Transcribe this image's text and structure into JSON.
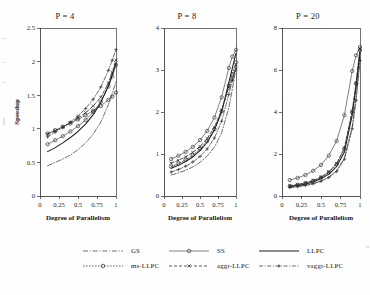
{
  "figure": {
    "background": "#fefefe",
    "ink": "#2b2b2b"
  },
  "axis": {
    "xlabel": "Degree of Parallelism",
    "ylabel": "Speedup",
    "xticks": [
      "0",
      "0.25",
      "0.5",
      "0.75",
      "1"
    ],
    "xtickvals": [
      0,
      0.25,
      0.5,
      0.75,
      1
    ]
  },
  "legend": {
    "rows": [
      [
        {
          "label": "GS",
          "style": "dashdot-long",
          "marker": "none"
        },
        {
          "label": "SS",
          "style": "solid-thin",
          "marker": "circle"
        },
        {
          "label": "LLPC",
          "style": "solid",
          "marker": "none"
        }
      ],
      [
        {
          "label": "ms-LLPC",
          "style": "dashed-fine",
          "marker": "circle"
        },
        {
          "label": "aggr-LLPC",
          "style": "dashed",
          "marker": "x"
        },
        {
          "label": "vaggr-LLPC",
          "style": "dashdot",
          "marker": "plus"
        }
      ]
    ]
  },
  "chart_data": [
    {
      "type": "line",
      "title": "P = 4",
      "xlabel": "Degree of Parallelism",
      "ylabel": "Speedup",
      "xlim": [
        0,
        1
      ],
      "ylim": [
        0,
        2.5
      ],
      "yticks": [
        0,
        0.5,
        1,
        1.5,
        2,
        2.5
      ],
      "yticklabels": [
        "0",
        "0.5",
        "1",
        "1.5",
        "2",
        "2.5"
      ],
      "grid": false,
      "legend_position": "below",
      "x": [
        0.1,
        0.2,
        0.3,
        0.4,
        0.5,
        0.6,
        0.7,
        0.8,
        0.9,
        0.95,
        1.0
      ],
      "series": [
        {
          "name": "GS",
          "style": "dashdot-long",
          "marker": "none",
          "values": [
            0.45,
            0.5,
            0.55,
            0.61,
            0.69,
            0.79,
            0.92,
            1.1,
            1.36,
            1.52,
            1.7
          ]
        },
        {
          "name": "SS",
          "style": "solid-thin",
          "marker": "circle",
          "values": [
            0.77,
            0.83,
            0.89,
            0.96,
            1.04,
            1.13,
            1.25,
            1.4,
            1.63,
            1.78,
            1.95
          ]
        },
        {
          "name": "LLPC",
          "style": "solid",
          "marker": "none",
          "values": [
            0.66,
            0.72,
            0.79,
            0.87,
            0.96,
            1.07,
            1.21,
            1.39,
            1.64,
            1.8,
            1.98
          ]
        },
        {
          "name": "ms-LLPC",
          "style": "dashed-fine",
          "marker": "circle",
          "values": [
            0.93,
            0.98,
            1.03,
            1.08,
            1.14,
            1.2,
            1.27,
            1.34,
            1.43,
            1.48,
            1.54
          ]
        },
        {
          "name": "aggr-LLPC",
          "style": "dashed",
          "marker": "x",
          "values": [
            0.92,
            0.97,
            1.03,
            1.09,
            1.16,
            1.24,
            1.34,
            1.47,
            1.68,
            1.84,
            2.02
          ]
        },
        {
          "name": "vaggr-LLPC",
          "style": "dashdot",
          "marker": "plus",
          "values": [
            0.88,
            0.95,
            1.02,
            1.1,
            1.19,
            1.3,
            1.44,
            1.62,
            1.87,
            2.02,
            2.18
          ]
        }
      ]
    },
    {
      "type": "line",
      "title": "P = 8",
      "xlabel": "Degree of Parallelism",
      "ylabel": "Speedup",
      "xlim": [
        0,
        1
      ],
      "ylim": [
        0,
        4
      ],
      "yticks": [
        0,
        1,
        2,
        3,
        4
      ],
      "yticklabels": [
        "0",
        "1",
        "2",
        "3",
        "4"
      ],
      "grid": false,
      "legend_position": "below",
      "x": [
        0.1,
        0.2,
        0.3,
        0.4,
        0.5,
        0.6,
        0.7,
        0.8,
        0.9,
        0.95,
        1.0
      ],
      "series": [
        {
          "name": "GS",
          "style": "dashdot-long",
          "marker": "none",
          "values": [
            0.5,
            0.55,
            0.61,
            0.69,
            0.8,
            0.95,
            1.16,
            1.5,
            2.1,
            2.55,
            3.05
          ]
        },
        {
          "name": "SS",
          "style": "solid-thin",
          "marker": "circle",
          "values": [
            0.88,
            0.96,
            1.05,
            1.17,
            1.33,
            1.55,
            1.87,
            2.35,
            3.05,
            3.32,
            3.48
          ]
        },
        {
          "name": "LLPC",
          "style": "solid",
          "marker": "none",
          "values": [
            0.66,
            0.73,
            0.82,
            0.93,
            1.08,
            1.28,
            1.57,
            2.0,
            2.7,
            3.05,
            3.4
          ]
        },
        {
          "name": "ms-LLPC",
          "style": "dashed-fine",
          "marker": "circle",
          "values": [
            0.7,
            0.77,
            0.86,
            0.97,
            1.12,
            1.31,
            1.59,
            2.02,
            2.63,
            2.9,
            3.18
          ]
        },
        {
          "name": "aggr-LLPC",
          "style": "dashed",
          "marker": "x",
          "values": [
            0.78,
            0.85,
            0.93,
            1.04,
            1.18,
            1.37,
            1.64,
            2.04,
            2.58,
            2.8,
            3.02
          ]
        },
        {
          "name": "vaggr-LLPC",
          "style": "dashdot",
          "marker": "plus",
          "values": [
            0.57,
            0.63,
            0.71,
            0.81,
            0.94,
            1.12,
            1.38,
            1.78,
            2.42,
            2.75,
            3.1
          ]
        }
      ]
    },
    {
      "type": "line",
      "title": "P = 20",
      "xlabel": "Degree of Parallelism",
      "ylabel": "Speedup",
      "xlim": [
        0,
        1
      ],
      "ylim": [
        0,
        8
      ],
      "yticks": [
        0,
        2,
        4,
        6,
        8
      ],
      "yticklabels": [
        "0",
        "2",
        "4",
        "6",
        "8"
      ],
      "grid": false,
      "legend_position": "below",
      "x": [
        0.1,
        0.2,
        0.3,
        0.4,
        0.5,
        0.6,
        0.7,
        0.8,
        0.9,
        0.95,
        1.0
      ],
      "series": [
        {
          "name": "GS",
          "style": "dashdot-long",
          "marker": "none",
          "values": [
            0.42,
            0.46,
            0.52,
            0.6,
            0.72,
            0.9,
            1.2,
            1.8,
            3.3,
            4.7,
            6.6
          ]
        },
        {
          "name": "SS",
          "style": "solid-thin",
          "marker": "circle",
          "values": [
            0.76,
            0.86,
            1.0,
            1.2,
            1.48,
            1.92,
            2.62,
            3.85,
            5.95,
            6.7,
            7.1
          ]
        },
        {
          "name": "LLPC",
          "style": "solid",
          "marker": "none",
          "values": [
            0.45,
            0.5,
            0.57,
            0.67,
            0.82,
            1.04,
            1.4,
            2.1,
            3.85,
            5.2,
            6.85
          ]
        },
        {
          "name": "ms-LLPC",
          "style": "dashed-fine",
          "marker": "circle",
          "values": [
            0.47,
            0.53,
            0.61,
            0.72,
            0.88,
            1.12,
            1.52,
            2.25,
            4.0,
            5.35,
            6.95
          ]
        },
        {
          "name": "aggr-LLPC",
          "style": "dashed",
          "marker": "x",
          "values": [
            0.49,
            0.55,
            0.63,
            0.74,
            0.9,
            1.15,
            1.55,
            2.28,
            4.05,
            5.4,
            7.0
          ]
        },
        {
          "name": "vaggr-LLPC",
          "style": "dashdot",
          "marker": "plus",
          "values": [
            0.4,
            0.44,
            0.5,
            0.58,
            0.7,
            0.88,
            1.17,
            1.75,
            3.2,
            4.55,
            6.45
          ]
        }
      ]
    }
  ]
}
